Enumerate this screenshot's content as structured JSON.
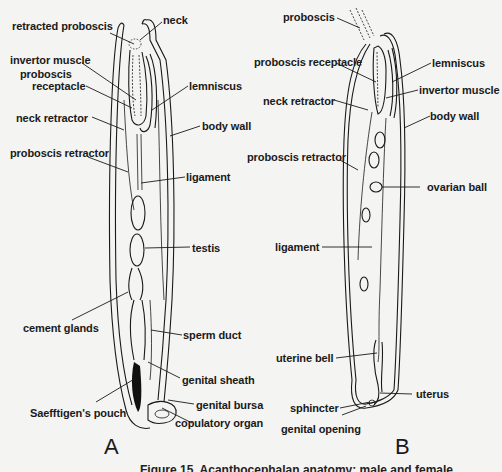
{
  "figure": {
    "caption": "Figure 15. Acanthocephalan anatomy: male and female",
    "panels": [
      {
        "letter": "A",
        "labels": {
          "retracted_proboscis": "retracted proboscis",
          "neck": "neck",
          "invertor_muscle": "invertor muscle",
          "proboscis_receptacle_1": "proboscis",
          "proboscis_receptacle_2": "receptacle",
          "lemniscus": "lemniscus",
          "neck_retractor": "neck retractor",
          "body_wall": "body wall",
          "proboscis_retractor": "proboscis retractor",
          "ligament": "ligament",
          "testis": "testis",
          "cement_glands": "cement glands",
          "sperm_duct": "sperm duct",
          "genital_sheath": "genital sheath",
          "saefftigens_pouch": "Saefftigen's pouch",
          "genital_bursa": "genital bursa",
          "copulatory_organ": "copulatory organ"
        }
      },
      {
        "letter": "B",
        "labels": {
          "proboscis": "proboscis",
          "proboscis_receptacle": "proboscis receptacle",
          "lemniscus": "lemniscus",
          "neck_retractor": "neck retractor",
          "invertor_muscle": "invertor muscle",
          "body_wall": "body wall",
          "proboscis_retractor": "proboscis retractor",
          "ovarian_ball": "ovarian ball",
          "ligament": "ligament",
          "uterine_bell": "uterine bell",
          "uterus": "uterus",
          "sphincter": "sphincter",
          "genital_opening": "genital opening"
        }
      }
    ]
  }
}
